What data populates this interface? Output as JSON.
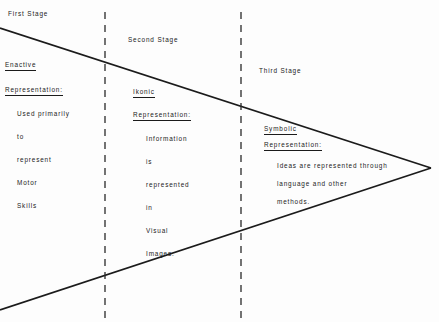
{
  "diagram": {
    "type": "triangle-arrow-diagram",
    "background_color": "#fdfdfd",
    "line_color": "#1b1b1b",
    "text_color": "#1b1b1b",
    "shape": {
      "name": "wedge",
      "apex": {
        "x": 431,
        "y": 168
      },
      "upper_left": {
        "x": 0,
        "y": 28
      },
      "lower_left": {
        "x": 0,
        "y": 310
      },
      "stroke_width": 1.6
    },
    "dividers": [
      {
        "name": "divider-1",
        "x": 105,
        "y_start": 12,
        "y_end": 320,
        "style": "dashed"
      },
      {
        "name": "divider-2",
        "x": 241,
        "y_start": 12,
        "y_end": 320,
        "style": "dashed"
      }
    ],
    "stages": [
      {
        "id": "first",
        "stage_label": "First Stage",
        "heading": "Enactive",
        "subheading": "Representation:",
        "body_lines": [
          "Used primarily",
          "to",
          "represent",
          "Motor",
          "Skills"
        ]
      },
      {
        "id": "second",
        "stage_label": "Second Stage",
        "heading": "Ikonic",
        "subheading": "Representation:",
        "body_lines": [
          "Information",
          "is",
          "represented",
          "in",
          "Visual",
          "Images."
        ]
      },
      {
        "id": "third",
        "stage_label": "Third Stage",
        "heading": "Symbolic",
        "subheading": "Representation:",
        "body_lines": [
          "Ideas are represented through",
          "language and other",
          "methods."
        ]
      }
    ]
  }
}
